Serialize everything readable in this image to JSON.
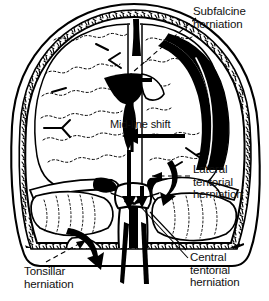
{
  "figure": {
    "kind": "anatomical-line-drawing",
    "ink_color": "#000000",
    "background_color": "#ffffff",
    "lesion_color": "#000000",
    "lesion_description": "large black crescentic extra-axial hematoma over right convexity with smaller black collection at left skull base"
  },
  "labels": {
    "subfalcine": "Subfalcine\nherniation",
    "midline_shift": "Mid-line shift",
    "lateral_tentorial": "Lateral\ntentorial\nherniation",
    "central_tentorial": "Central\ntentorial\nherniation",
    "tonsillar": "Tonsillar\nherniation"
  },
  "annotations": {
    "leader_subfalcine": "dashed leader from Subfalcine herniation label down-left to solid arrow pointing left beneath falx",
    "leader_lateral": "dashed leader from Lateral tentorial herniation label left to solid arrow at tentorial incisura",
    "leader_central": "solid leader from Central tentorial herniation label up-left to midbrain region",
    "leader_tonsillar": "dashed leader from Tonsillar herniation label up-right to curved hook arrow at cerebellar tonsil",
    "arrow_midline": "bold solid arrow pointing left indicating mid-line shift",
    "arrow_downward": "bold vertical arrows directed caudally through the incisura into the foramen magnum"
  }
}
